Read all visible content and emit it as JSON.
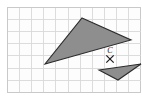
{
  "figure": {
    "background_color": "#ffffff",
    "grid": {
      "line_color": "#d8d8d8",
      "border_color": "#c9c9c9",
      "fill_color": "#fdfdfd",
      "cell_size": 12.1,
      "x0": 7,
      "y0": 7,
      "x1": 141,
      "y1": 92,
      "columns": 11,
      "rows": 7
    },
    "shapes": [
      {
        "name": "large-triangle",
        "fill": "#8e8e8e",
        "stroke": "#2b2b2b",
        "points": "82,18 131,40 45,64"
      },
      {
        "name": "small-triangle",
        "fill": "#8e8e8e",
        "stroke": "#2b2b2b",
        "points": "141,64 118,80 99,70"
      }
    ],
    "center_point": {
      "label": "C",
      "marker": "x-marker",
      "x": 110,
      "y": 59,
      "radius": 4,
      "label_x": 110,
      "label_y": 52,
      "color": "#1c1c1c"
    }
  }
}
